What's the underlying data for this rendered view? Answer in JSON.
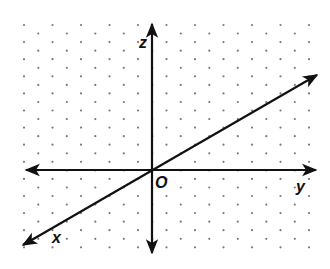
{
  "diagram": {
    "colors": {
      "background": "#ffffff",
      "axis": "#111111",
      "dot": "#7a7a7a"
    },
    "dot_grid": {
      "x_start": 24,
      "x_step": 28.5,
      "row_start_y": 25,
      "row_step": 8.55,
      "rows": 27,
      "cols": 11,
      "odd_row_offset": 14.25,
      "radius": 1.1
    },
    "axes": [
      {
        "name": "z-axis",
        "x1": 152,
        "y1": 253,
        "x2": 152,
        "y2": 24,
        "both_ends": true
      },
      {
        "name": "y-axis",
        "x1": 26,
        "y1": 170,
        "x2": 316,
        "y2": 170,
        "both_ends": true
      },
      {
        "name": "x-axis",
        "x1": 23,
        "y1": 245,
        "x2": 317,
        "y2": 75,
        "both_ends": true
      }
    ],
    "labels": {
      "z": {
        "text": "z",
        "x": 139,
        "y": 48,
        "size": 16
      },
      "y": {
        "text": "y",
        "x": 296,
        "y": 192,
        "size": 16
      },
      "x": {
        "text": "x",
        "x": 52,
        "y": 243,
        "size": 16
      },
      "origin": {
        "text": "O",
        "x": 155,
        "y": 188,
        "size": 16
      }
    }
  }
}
